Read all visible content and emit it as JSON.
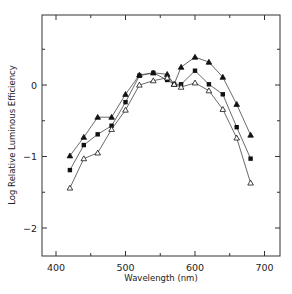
{
  "chart_data": {
    "type": "line",
    "title": "",
    "xlabel": "Wavelength (nm)",
    "ylabel": "Log Relative  Luminous Efficiency",
    "xlim": [
      380,
      720
    ],
    "ylim": [
      -2.4,
      0.95
    ],
    "x_ticks": [
      400,
      500,
      600,
      700
    ],
    "x_minor_ticks": [
      450,
      550,
      650
    ],
    "y_ticks": [
      0,
      -1,
      -2
    ],
    "y_minor_ticks": [
      0.5,
      -0.5,
      -1.5
    ],
    "grid": false,
    "legend": null,
    "series": [
      {
        "name": "filled-triangle",
        "marker": "filled-triangle",
        "x": [
          420,
          440,
          460,
          480,
          500,
          520,
          540,
          560,
          570,
          580,
          600,
          620,
          640,
          660,
          680
        ],
        "y": [
          -0.99,
          -0.73,
          -0.45,
          -0.45,
          -0.13,
          0.14,
          0.17,
          0.15,
          0.01,
          0.25,
          0.39,
          0.32,
          0.11,
          -0.27,
          -0.7
        ]
      },
      {
        "name": "filled-square",
        "marker": "filled-square",
        "x": [
          420,
          440,
          460,
          480,
          500,
          520,
          540,
          560,
          570,
          580,
          600,
          620,
          640,
          660,
          680
        ],
        "y": [
          -1.19,
          -0.84,
          -0.69,
          -0.57,
          -0.24,
          0.13,
          0.17,
          0.07,
          0.01,
          0.01,
          0.2,
          0.01,
          -0.13,
          -0.59,
          -1.03
        ]
      },
      {
        "name": "open-triangle",
        "marker": "open-triangle",
        "x": [
          420,
          440,
          460,
          480,
          500,
          520,
          540,
          560,
          570,
          580,
          600,
          620,
          640,
          660,
          680
        ],
        "y": [
          -1.44,
          -1.03,
          -0.95,
          -0.62,
          -0.35,
          0.0,
          0.06,
          0.1,
          0.01,
          -0.03,
          0.03,
          -0.08,
          -0.34,
          -0.74,
          -1.37
        ]
      }
    ]
  }
}
